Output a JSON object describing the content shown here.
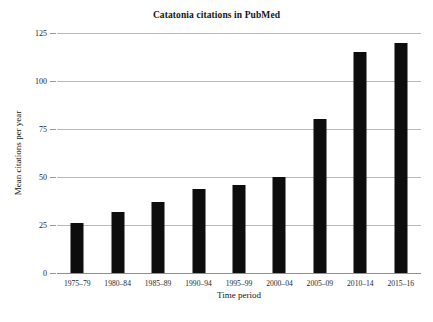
{
  "chart_data": {
    "type": "bar",
    "title": "Catatonia citations in PubMed",
    "xlabel": "Time period",
    "ylabel": "Mean citations per year",
    "categories": [
      "1975–79",
      "1980–84",
      "1985–89",
      "1990–94",
      "1995–99",
      "2000–04",
      "2005–09",
      "2010–14",
      "2015–16"
    ],
    "values": [
      26,
      32,
      37,
      44,
      46,
      50,
      80,
      115,
      120
    ],
    "ylim": [
      0,
      125
    ],
    "yticks": [
      0,
      25,
      50,
      75,
      100,
      125
    ],
    "ytick_labels": [
      "0",
      "25",
      "50",
      "75",
      "100",
      "125"
    ],
    "grid": true,
    "legend": false,
    "bar_color": "#0d0d0d",
    "gridline_color": "#b9b9b9"
  },
  "caption": {
    "text": ""
  }
}
